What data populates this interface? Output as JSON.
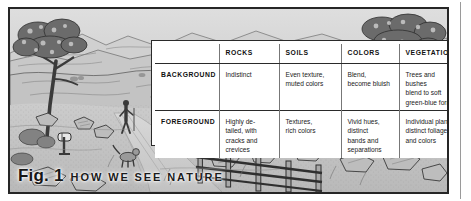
{
  "figure": {
    "caption_label": "Fig. 1",
    "caption_title": "HOW WE SEE NATURE",
    "illustration_alt": "landscape-drawing",
    "scene_elements": [
      "oak-tree-left",
      "oak-tree-right",
      "rolling-hills",
      "distant-mountains",
      "dirt-road",
      "standing-figure",
      "mailbox",
      "dog",
      "wooden-rail-fence",
      "foreground-boulders",
      "shrubs"
    ]
  },
  "table": {
    "corner_label": "",
    "columns": [
      "ROCKS",
      "SOILS",
      "COLORS",
      "VEGETATION"
    ],
    "rows": [
      {
        "label": "BACKGROUND",
        "cells": [
          "Indistinct",
          "Even texture,\nmuted colors",
          "Blend,\nbecome bluish",
          "Trees and bushes\nblend to soft\ngreen-blue forms"
        ]
      },
      {
        "label": "FOREGROUND",
        "cells": [
          "Highly de-\ntailed, with\ncracks and\ncrevices",
          "Textures,\nrich colors",
          "Vivid hues,\ndistinct\nbands and\nseparations",
          "Individual plants,\ndistinct foliage\nand colors"
        ]
      }
    ]
  },
  "colors": {
    "frame_border": "#262626",
    "table_border": "#2a2a2a",
    "table_inner_rule": "#777777",
    "table_background": "#ffffff",
    "text": "#222222",
    "heading_text": "#101010",
    "page_background": "#ffffff",
    "sky": "#d9d9d9",
    "ground": "#c9c9c9"
  }
}
